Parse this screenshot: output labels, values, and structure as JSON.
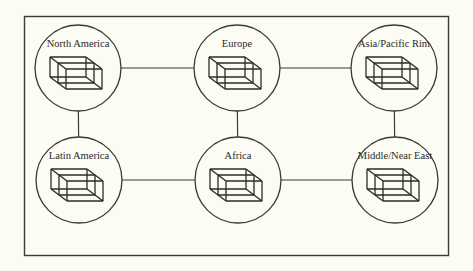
{
  "diagram": {
    "type": "network",
    "nodes": [
      {
        "id": "north-america",
        "label": "North America",
        "icon": "data-cube-icon"
      },
      {
        "id": "europe",
        "label": "Europe",
        "icon": "data-cube-icon"
      },
      {
        "id": "asia-pacific-rim",
        "label": "Asia/Pacific Rim",
        "icon": "data-cube-icon"
      },
      {
        "id": "latin-america",
        "label": "Latin America",
        "icon": "data-cube-icon"
      },
      {
        "id": "africa",
        "label": "Africa",
        "icon": "data-cube-icon"
      },
      {
        "id": "middle-near-east",
        "label": "Middle/Near East",
        "icon": "data-cube-icon"
      }
    ],
    "edges": [
      {
        "from": "north-america",
        "to": "europe"
      },
      {
        "from": "europe",
        "to": "asia-pacific-rim"
      },
      {
        "from": "latin-america",
        "to": "africa"
      },
      {
        "from": "africa",
        "to": "middle-near-east"
      },
      {
        "from": "north-america",
        "to": "latin-america"
      },
      {
        "from": "europe",
        "to": "africa"
      },
      {
        "from": "asia-pacific-rim",
        "to": "middle-near-east"
      }
    ],
    "colors": {
      "background": "#fcfcf5",
      "stroke": "#3a3a36",
      "text": "#2b2b28"
    }
  }
}
